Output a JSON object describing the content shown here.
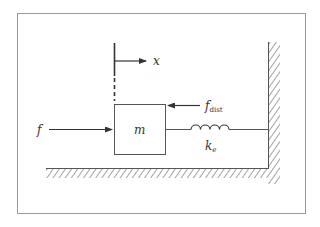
{
  "diagram": {
    "type": "mass-spring system",
    "colors": {
      "line": "#555555",
      "frame": "#9a9a9a",
      "background": "#ffffff",
      "text": "#333333"
    },
    "labels": {
      "displacement": "x",
      "applied_force": "f",
      "disturbance_force_main": "f",
      "disturbance_force_sub": "dist",
      "mass": "m",
      "spring_main": "k",
      "spring_sub": "e"
    }
  }
}
